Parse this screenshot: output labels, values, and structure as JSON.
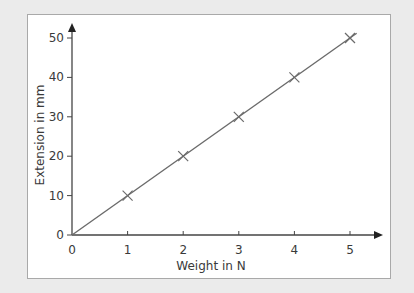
{
  "chart_data": {
    "type": "line",
    "title": "",
    "xlabel": "Weight in N",
    "ylabel": "Extension in mm",
    "x": [
      1,
      2,
      3,
      4,
      5
    ],
    "series": [
      {
        "name": "Extension",
        "values": [
          10,
          20,
          30,
          40,
          50
        ],
        "marker": "x",
        "line_from_origin": true
      }
    ],
    "xticks": [
      0,
      1,
      2,
      3,
      4,
      5
    ],
    "yticks": [
      0,
      10,
      20,
      30,
      40,
      50
    ],
    "xlim": [
      0,
      5.5
    ],
    "ylim": [
      0,
      53
    ],
    "grid": false,
    "legend": "none",
    "colors": {
      "line": "#6b6b6b",
      "axis": "#444444",
      "frame_border": "#a9a9a9",
      "background": "#ebebeb",
      "plot_bg": "#ffffff"
    }
  }
}
